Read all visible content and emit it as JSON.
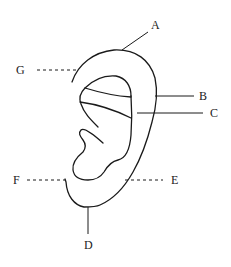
{
  "diagram": {
    "labels": [
      {
        "id": "A",
        "text": "A",
        "leader": "solid"
      },
      {
        "id": "B",
        "text": "B",
        "leader": "solid"
      },
      {
        "id": "C",
        "text": "C",
        "leader": "solid"
      },
      {
        "id": "D",
        "text": "D",
        "leader": "solid"
      },
      {
        "id": "E",
        "text": "E",
        "leader": "dashed"
      },
      {
        "id": "F",
        "text": "F",
        "leader": "dashed"
      },
      {
        "id": "G",
        "text": "G",
        "leader": "dashed"
      }
    ],
    "colors": {
      "line": "#1a1a1a",
      "background": "#ffffff"
    }
  }
}
